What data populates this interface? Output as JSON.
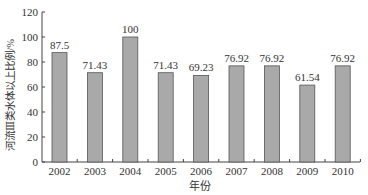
{
  "chart_data": {
    "type": "bar",
    "title": "",
    "xlabel": "年份",
    "ylabel": "河流Ⅲ类水体以上比例/%",
    "categories": [
      "2002",
      "2003",
      "2004",
      "2005",
      "2006",
      "2007",
      "2008",
      "2009",
      "2010"
    ],
    "values": [
      87.5,
      71.43,
      100,
      71.43,
      69.23,
      76.92,
      76.92,
      61.54,
      76.92
    ],
    "data_labels": [
      "87.5",
      "71.43",
      "100",
      "71.43",
      "69.23",
      "76.92",
      "76.92",
      "61.54",
      "76.92"
    ],
    "ylim": [
      0,
      120
    ],
    "yticks": [
      0,
      20,
      40,
      60,
      80,
      100,
      120
    ],
    "grid": false,
    "legend": null,
    "colors": {
      "bar_fill": "#a9a9a9",
      "bar_stroke": "#555555",
      "axis": "#444444"
    }
  }
}
